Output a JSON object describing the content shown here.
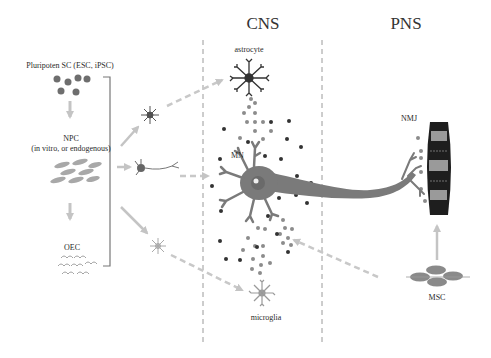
{
  "regions": {
    "cns": {
      "title": "CNS"
    },
    "pns": {
      "title": "PNS"
    }
  },
  "sources": {
    "pluripotent": {
      "label": "Pluripoten SC (ESC, iPSC)"
    },
    "npc": {
      "label": "NPC",
      "sublabel": "(in vitro, or endogenous)"
    },
    "oec": {
      "label": "OEC"
    },
    "msc": {
      "label": "MSC"
    }
  },
  "cells": {
    "astrocyte": {
      "label": "astrocyte"
    },
    "motor_neuron": {
      "label": "MN"
    },
    "microglia": {
      "label": "microglia"
    },
    "nmj": {
      "label": "NMJ"
    }
  },
  "colors": {
    "arrow": "#c8c8c8",
    "neuron": "#7a7a7a",
    "dot_dark": "#3a3a3a",
    "dot_grey": "#8c8c8c",
    "muscle_dark": "#1a1a1a",
    "muscle_band": "#9a9a9a",
    "divider": "#999999"
  }
}
